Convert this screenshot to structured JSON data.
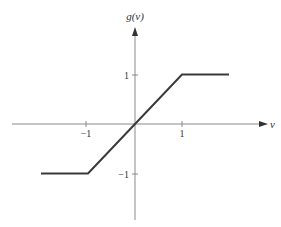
{
  "chart_data": {
    "type": "line",
    "title": "",
    "xlabel": "v",
    "ylabel": "g(v)",
    "x": [
      -2,
      -1,
      0,
      1,
      2
    ],
    "series": [
      {
        "name": "g(v)",
        "values": [
          -1,
          -1,
          0,
          1,
          1
        ]
      }
    ],
    "xticks": [
      -1,
      1
    ],
    "yticks": [
      -1,
      1
    ],
    "xtick_labels": [
      "−1",
      "1"
    ],
    "ytick_labels": [
      "−1",
      "1"
    ],
    "xlim": [
      -2.6,
      2.8
    ],
    "ylim": [
      -2,
      2
    ],
    "grid": false,
    "legend": "none",
    "colors": {
      "line": "#3a3a3a",
      "axis": "#8a8a8a"
    }
  },
  "labels": {
    "x_axis": "v",
    "y_axis": "g(v)",
    "x_tick_neg1": "−1",
    "x_tick_pos1": "1",
    "y_tick_pos1": "1",
    "y_tick_neg1": "−1"
  }
}
